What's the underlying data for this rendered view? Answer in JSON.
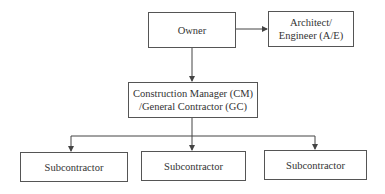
{
  "diagram": {
    "type": "organization-chart",
    "nodes": {
      "owner": {
        "lines": [
          "Owner"
        ]
      },
      "architect": {
        "lines": [
          "Architect/",
          "Engineer (A/E)"
        ]
      },
      "cm": {
        "lines": [
          "Construction Manager (CM)",
          "/General Contractor (GC)"
        ]
      },
      "sub1": {
        "lines": [
          "Subcontractor"
        ]
      },
      "sub2": {
        "lines": [
          "Subcontractor"
        ]
      },
      "sub3": {
        "lines": [
          "Subcontractor"
        ]
      }
    },
    "edges": [
      {
        "from": "owner",
        "to": "architect"
      },
      {
        "from": "owner",
        "to": "cm"
      },
      {
        "from": "cm",
        "to": "sub1"
      },
      {
        "from": "cm",
        "to": "sub2"
      },
      {
        "from": "cm",
        "to": "sub3"
      }
    ],
    "colors": {
      "line": "#444444",
      "border": "#555555",
      "text": "#333333"
    }
  }
}
